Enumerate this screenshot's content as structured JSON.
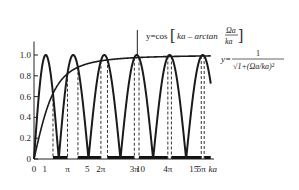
{
  "chart_data": {
    "type": "line",
    "title": "",
    "xlabel": "ka",
    "ylabel": "",
    "xlim": [
      0,
      17
    ],
    "ylim": [
      0,
      1.1
    ],
    "grid": false,
    "x_ticks": [
      {
        "value": 0,
        "label": "0"
      },
      {
        "value": 1,
        "label": "1"
      },
      {
        "value": 3.1416,
        "label": "π"
      },
      {
        "value": 5,
        "label": "5"
      },
      {
        "value": 6.2832,
        "label": "2π"
      },
      {
        "value": 9.4248,
        "label": "3π"
      },
      {
        "value": 10,
        "label": "10"
      },
      {
        "value": 12.5664,
        "label": "4π"
      },
      {
        "value": 15,
        "label": "15"
      },
      {
        "value": 15.708,
        "label": "5π"
      }
    ],
    "y_ticks": [
      {
        "value": 0,
        "label": "0"
      },
      {
        "value": 0.2,
        "label": "0.2"
      },
      {
        "value": 0.4,
        "label": "0.4"
      },
      {
        "value": 0.6,
        "label": "0.6"
      },
      {
        "value": 0.8,
        "label": "0.8"
      },
      {
        "value": 1.0,
        "label": "1.0"
      }
    ],
    "series": [
      {
        "name": "y = |cos[ka − arctan(Ωa/ka)]|",
        "formula": "abs(cos(ka - atan(omega_a/ka)))",
        "omega_a": 2.2,
        "style": "solid"
      },
      {
        "name": "y = 1/√(1+(Ωa/ka)²)",
        "formula": "1/sqrt(1+(omega_a/ka)^2)",
        "omega_a": 2.2,
        "style": "solid"
      }
    ],
    "allowed_bands_note": "dashed verticals mark where |cos| curve crosses the envelope; thick bars on x-axis mark forbidden bands",
    "annotations": {
      "curve1_label": {
        "prefix": "y=cos",
        "bracket_body": "ka – arctan",
        "frac_num": "Ωa",
        "frac_den": "ka"
      },
      "curve2_label": {
        "prefix": "y=",
        "frac_num": "1",
        "frac_den": "√1+(Ωa/ka)²"
      }
    }
  }
}
